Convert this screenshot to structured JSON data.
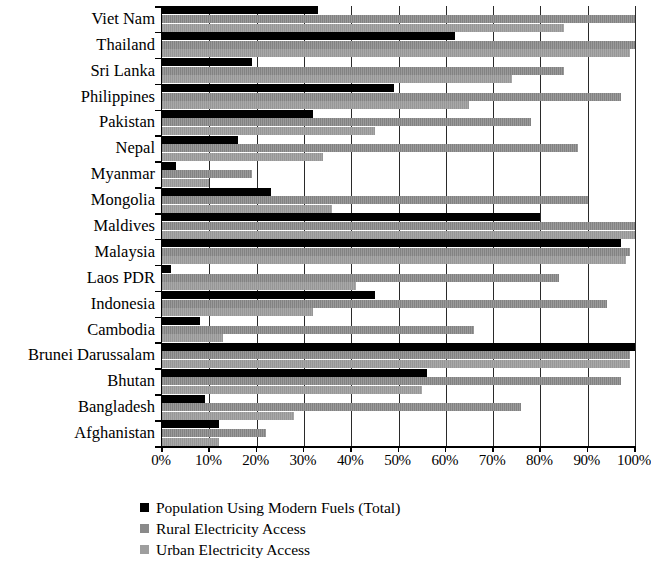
{
  "chart_data": {
    "type": "bar",
    "orientation": "horizontal",
    "title": "",
    "xlabel": "",
    "ylabel": "",
    "xlim": [
      0,
      100
    ],
    "xticks": [
      "0%",
      "10%",
      "20%",
      "30%",
      "40%",
      "50%",
      "60%",
      "70%",
      "80%",
      "90%",
      "100%"
    ],
    "xtick_values": [
      0,
      10,
      20,
      30,
      40,
      50,
      60,
      70,
      80,
      90,
      100
    ],
    "grid": true,
    "legend_position": "bottom-left",
    "categories": [
      "Viet Nam",
      "Thailand",
      "Sri Lanka",
      "Philippines",
      "Pakistan",
      "Nepal",
      "Myanmar",
      "Mongolia",
      "Maldives",
      "Malaysia",
      "Laos PDR",
      "Indonesia",
      "Cambodia",
      "Brunei Darussalam",
      "Bhutan",
      "Bangladesh",
      "Afghanistan"
    ],
    "series": [
      {
        "name": "Population Using Modern Fuels (Total)",
        "color": "#000000",
        "values": [
          33,
          62,
          19,
          49,
          32,
          16,
          3,
          23,
          80,
          97,
          2,
          45,
          8,
          100,
          56,
          9,
          12
        ]
      },
      {
        "name": "Rural Electricity Access",
        "color": "#8a8a8a",
        "values": [
          100,
          100,
          85,
          97,
          78,
          88,
          19,
          90,
          100,
          99,
          84,
          94,
          66,
          99,
          97,
          76,
          22
        ]
      },
      {
        "name": "Urban Electricity Access",
        "color": "#9e9e9e",
        "values": [
          85,
          99,
          74,
          65,
          45,
          34,
          10,
          36,
          100,
          98,
          41,
          32,
          13,
          99,
          55,
          28,
          12
        ]
      }
    ]
  },
  "legend": {
    "items": [
      {
        "label": "Population Using Modern Fuels (Total)",
        "swatch": "total"
      },
      {
        "label": "Rural Electricity Access",
        "swatch": "rural"
      },
      {
        "label": "Urban Electricity Access",
        "swatch": "urban"
      }
    ]
  }
}
